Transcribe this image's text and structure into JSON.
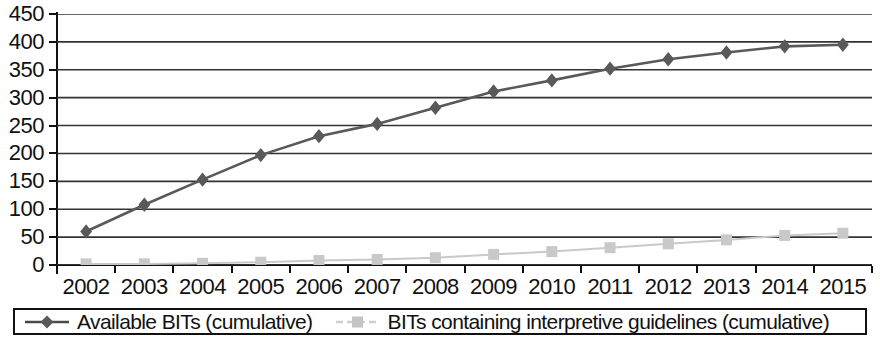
{
  "chart_data": {
    "type": "line",
    "title": "",
    "subtitle": "",
    "xlabel": "",
    "ylabel": "",
    "categories": [
      "2002",
      "2003",
      "2004",
      "2005",
      "2006",
      "2007",
      "2008",
      "2009",
      "2010",
      "2011",
      "2012",
      "2013",
      "2014",
      "2015"
    ],
    "series": [
      {
        "name": "Available BITs (cumulative)",
        "values": [
          60,
          108,
          153,
          197,
          231,
          253,
          282,
          311,
          331,
          352,
          369,
          381,
          392,
          395
        ],
        "color": "#595959",
        "marker": "diamond",
        "line_style": "solid"
      },
      {
        "name": "BITs containing interpretive guidelines (cumulative)",
        "values": [
          2,
          2,
          3,
          5,
          8,
          10,
          13,
          19,
          24,
          31,
          38,
          45,
          53,
          57
        ],
        "color": "#c9c9c9",
        "marker": "square",
        "line_style": "solid"
      }
    ],
    "ylim": [
      0,
      450
    ],
    "y_ticks": [
      0,
      50,
      100,
      150,
      200,
      250,
      300,
      350,
      400,
      450
    ],
    "y_tick_labels": [
      "0",
      "50",
      "100",
      "150",
      "200",
      "250",
      "300",
      "350",
      "400",
      "450"
    ],
    "grid": true,
    "grid_axis": "y",
    "legend_position": "bottom"
  },
  "legend": {
    "entries": [
      {
        "label": "Available BITs (cumulative)",
        "icon": "diamond-marker-icon"
      },
      {
        "label": "BITs containing interpretive guidelines (cumulative)",
        "icon": "square-marker-icon"
      }
    ]
  },
  "colors": {
    "series_available": "#595959",
    "series_guidelines": "#c9c9c9",
    "axis": "#111111",
    "grid": "#333333",
    "background": "#ffffff"
  }
}
